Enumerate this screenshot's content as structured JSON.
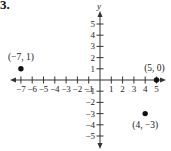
{
  "problem_number": "3.",
  "chart_data": {
    "type": "scatter",
    "title": "",
    "xlabel": "",
    "ylabel": "y",
    "xlim": [
      -7,
      5
    ],
    "ylim": [
      -5,
      5
    ],
    "grid": false,
    "x_ticks": [
      -7,
      -6,
      -5,
      -4,
      -3,
      -2,
      -1,
      1,
      2,
      3,
      4,
      5
    ],
    "y_ticks": [
      -5,
      -4,
      -3,
      -2,
      -1,
      1,
      2,
      3,
      4,
      5
    ],
    "x_tick_labels": [
      "−7",
      "−6",
      "−5",
      "−4",
      "−3",
      "−2",
      "−1",
      "1",
      "2",
      "3",
      "4",
      "5"
    ],
    "y_tick_labels": [
      "−5",
      "−4",
      "−3",
      "−2",
      "−1",
      "1",
      "2",
      "3",
      "4",
      "5"
    ],
    "points": [
      {
        "x": -7,
        "y": 1,
        "label": "(−7, 1)"
      },
      {
        "x": 5,
        "y": 0,
        "label": "(5, 0)"
      },
      {
        "x": 4,
        "y": -3,
        "label": "(4, −3)"
      }
    ]
  },
  "layout": {
    "origin_x": 100,
    "origin_y": 80,
    "unit_x": 11.3,
    "unit_y": 11.2,
    "x_axis_left": 10,
    "x_axis_right": 166,
    "y_axis_top": 11,
    "y_axis_bottom": 149,
    "axis_color": "#333333",
    "point_color": "#111111"
  }
}
